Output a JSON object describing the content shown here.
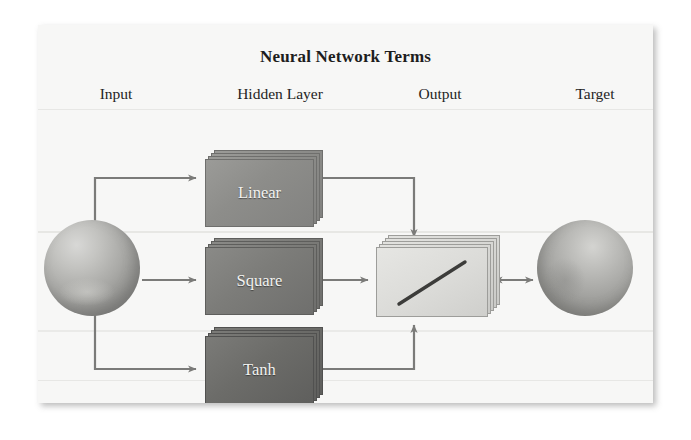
{
  "figure": {
    "title": "Neural Network Terms",
    "columns": [
      {
        "id": "input",
        "label": "Input"
      },
      {
        "id": "hidden",
        "label": "Hidden Layer"
      },
      {
        "id": "output",
        "label": "Output"
      },
      {
        "id": "target",
        "label": "Target"
      }
    ],
    "nodes": {
      "input": {
        "label": "",
        "shape": "sphere"
      },
      "target": {
        "label": "",
        "shape": "sphere"
      },
      "output": {
        "label": "",
        "shape": "stacked-card",
        "glyph": "diagonal-line"
      },
      "hidden": [
        {
          "id": "linear",
          "label": "Linear",
          "shape": "stacked-card"
        },
        {
          "id": "square",
          "label": "Square",
          "shape": "stacked-card"
        },
        {
          "id": "tanh",
          "label": "Tanh",
          "shape": "stacked-card"
        }
      ]
    },
    "edges": [
      {
        "from": "input",
        "to": "linear",
        "style": "elbow-arrow"
      },
      {
        "from": "input",
        "to": "square",
        "style": "straight-arrow"
      },
      {
        "from": "input",
        "to": "tanh",
        "style": "elbow-arrow"
      },
      {
        "from": "linear",
        "to": "output",
        "style": "elbow-arrow"
      },
      {
        "from": "square",
        "to": "output",
        "style": "straight-arrow"
      },
      {
        "from": "tanh",
        "to": "output",
        "style": "elbow-arrow"
      },
      {
        "from": "output",
        "to": "target",
        "style": "double-arrow"
      }
    ],
    "colors": {
      "panel_background": "#f7f7f6",
      "page_background": "#ffffff",
      "title_text": "#1d1d1d",
      "label_text": "#232323",
      "wire": "#7b7b79",
      "node_linear": "#8d8d8a",
      "node_square": "#7c7c79",
      "node_tanh": "#6c6c69",
      "node_output": "#dbdbd8",
      "sphere": "#a9a9a6",
      "diagonal_line": "#3c3c3a"
    }
  }
}
